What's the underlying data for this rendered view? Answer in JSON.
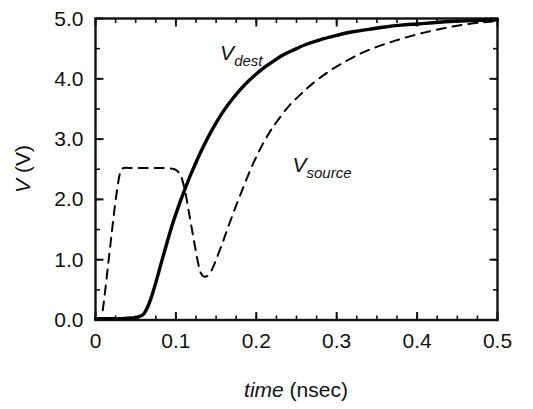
{
  "chart_data": {
    "type": "line",
    "title": "",
    "xlabel": "time (nsec)",
    "xlabel_italic_part": "time",
    "xlabel_plain_part": " (nsec)",
    "ylabel": "V (V)",
    "ylabel_italic_part": "V",
    "ylabel_plain_part": " (V)",
    "xlim": [
      0,
      0.5
    ],
    "ylim": [
      0,
      5.0
    ],
    "grid": false,
    "legend_position": "inline-annotations",
    "xticks": [
      0,
      0.1,
      0.2,
      0.3,
      0.4,
      0.5
    ],
    "xtick_labels": [
      "0",
      "0.1",
      "0.2",
      "0.3",
      "0.4",
      "0.5"
    ],
    "xminor_step": 0.025,
    "yticks": [
      0.0,
      1.0,
      2.0,
      3.0,
      4.0,
      5.0
    ],
    "ytick_labels": [
      "0.0",
      "1.0",
      "2.0",
      "3.0",
      "4.0",
      "5.0"
    ],
    "yminor_step": 0.5,
    "axis_color": "#111111",
    "background_color": "#ffffff",
    "series": [
      {
        "name": "V_dest",
        "label_main": "V",
        "label_sub": "dest",
        "style": "solid",
        "color": "#000000",
        "width": 3.4,
        "label_x": 0.155,
        "label_y": 4.32,
        "x": [
          0.0,
          0.01,
          0.02,
          0.03,
          0.04,
          0.05,
          0.055,
          0.06,
          0.065,
          0.07,
          0.075,
          0.08,
          0.085,
          0.09,
          0.095,
          0.1,
          0.105,
          0.11,
          0.115,
          0.12,
          0.13,
          0.14,
          0.15,
          0.16,
          0.17,
          0.18,
          0.19,
          0.2,
          0.21,
          0.22,
          0.23,
          0.24,
          0.25,
          0.26,
          0.28,
          0.3,
          0.32,
          0.34,
          0.36,
          0.38,
          0.4,
          0.42,
          0.44,
          0.46,
          0.48,
          0.5
        ],
        "y": [
          0.02,
          0.02,
          0.02,
          0.02,
          0.03,
          0.04,
          0.06,
          0.1,
          0.22,
          0.4,
          0.62,
          0.86,
          1.1,
          1.33,
          1.56,
          1.76,
          1.95,
          2.13,
          2.3,
          2.46,
          2.76,
          3.03,
          3.27,
          3.48,
          3.66,
          3.82,
          3.96,
          4.08,
          4.19,
          4.28,
          4.37,
          4.44,
          4.5,
          4.56,
          4.65,
          4.72,
          4.78,
          4.82,
          4.86,
          4.89,
          4.91,
          4.93,
          4.95,
          4.96,
          4.97,
          4.98
        ]
      },
      {
        "name": "V_source",
        "label_main": "V",
        "label_sub": "source",
        "style": "dashed",
        "color": "#000000",
        "width": 2.0,
        "dash": "9,7",
        "label_x": 0.245,
        "label_y": 2.45,
        "x": [
          0.009,
          0.012,
          0.016,
          0.02,
          0.024,
          0.028,
          0.031,
          0.035,
          0.045,
          0.055,
          0.065,
          0.075,
          0.085,
          0.095,
          0.1,
          0.105,
          0.108,
          0.112,
          0.116,
          0.12,
          0.124,
          0.128,
          0.131,
          0.135,
          0.14,
          0.145,
          0.15,
          0.158,
          0.166,
          0.175,
          0.185,
          0.195,
          0.205,
          0.215,
          0.225,
          0.24,
          0.255,
          0.27,
          0.29,
          0.31,
          0.33,
          0.35,
          0.37,
          0.39,
          0.41,
          0.43,
          0.45,
          0.47,
          0.485,
          0.5
        ],
        "y": [
          0.16,
          0.48,
          0.95,
          1.42,
          1.88,
          2.26,
          2.46,
          2.52,
          2.52,
          2.52,
          2.52,
          2.52,
          2.52,
          2.51,
          2.49,
          2.42,
          2.32,
          2.1,
          1.8,
          1.5,
          1.2,
          0.92,
          0.78,
          0.72,
          0.74,
          0.84,
          1.0,
          1.28,
          1.58,
          1.9,
          2.24,
          2.56,
          2.84,
          3.08,
          3.28,
          3.54,
          3.74,
          3.92,
          4.12,
          4.28,
          4.42,
          4.53,
          4.62,
          4.7,
          4.77,
          4.83,
          4.88,
          4.92,
          4.94,
          4.96
        ]
      }
    ]
  }
}
